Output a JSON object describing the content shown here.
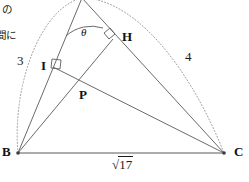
{
  "figure": {
    "margin_note": {
      "line1": "I の",
      "line2": "間に"
    },
    "points": {
      "A": {
        "label": "A",
        "x": 82,
        "y": -2,
        "visible": false
      },
      "B": {
        "label": "B",
        "x": 18,
        "y": 153,
        "visible": true
      },
      "C": {
        "label": "C",
        "x": 224,
        "y": 153,
        "visible": true
      },
      "H": {
        "label": "H",
        "x": 113,
        "y": 39,
        "visible": true
      },
      "I": {
        "label": "I",
        "x": 53,
        "y": 67,
        "visible": true
      },
      "P": {
        "label": "P",
        "x": 78,
        "y": 89,
        "visible": true
      }
    },
    "segment_labels": {
      "AB": "3",
      "AC": "4",
      "BC_radical_symbol": "√",
      "BC_radicand": "17",
      "BC_full": "√17"
    },
    "angle_labels": {
      "apex_angle": "θ"
    },
    "right_angle_marks": [
      {
        "at": "H",
        "name": "right-angle-at-h"
      },
      {
        "at": "I",
        "name": "right-angle-at-i"
      }
    ],
    "arcs": [
      {
        "name": "dotted-circumscribing-arc",
        "style": "dotted",
        "from": "B",
        "to": "C",
        "through": "A"
      }
    ],
    "colors": {
      "stroke": "#5a5a5a",
      "stroke_dark": "#3c3c3c",
      "dotted": "#9a9a9a",
      "text": "#111111",
      "background": "#ffffff"
    }
  }
}
